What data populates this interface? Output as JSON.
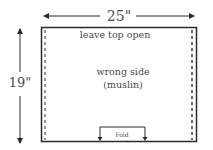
{
  "diagram": {
    "width_label": "25\"",
    "height_label": "19\"",
    "top_note": "leave top open",
    "center_line1": "wrong side",
    "center_line2": "(muslin)",
    "fold_label": "Fold",
    "colors": {
      "stroke": "#2b2b2b",
      "text": "#4a4a4a"
    }
  }
}
